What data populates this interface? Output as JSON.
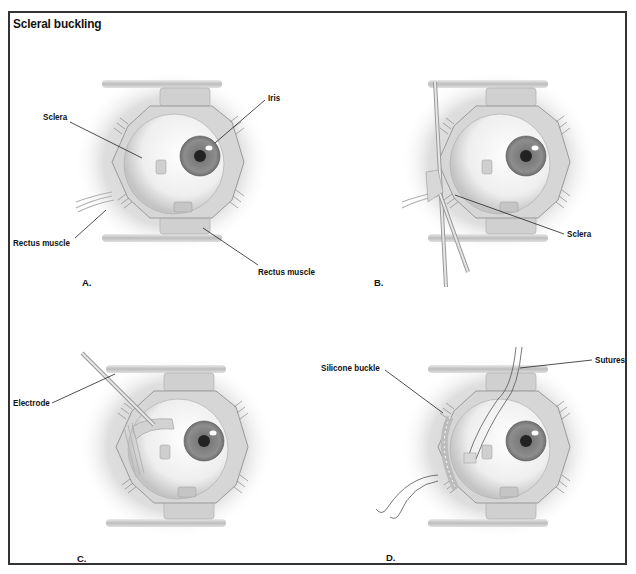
{
  "figure": {
    "title": "Scleral buckling",
    "panels": [
      {
        "letter": "A.",
        "labels": [
          "Sclera",
          "Iris",
          "Rectus muscle",
          "Rectus muscle"
        ]
      },
      {
        "letter": "B.",
        "labels": [
          "Sclera"
        ]
      },
      {
        "letter": "C.",
        "labels": [
          "Electrode"
        ]
      },
      {
        "letter": "D.",
        "labels": [
          "Silicone buckle",
          "Sutures"
        ]
      }
    ]
  },
  "colors": {
    "frame": "#333333",
    "halo": "#d9d9d9",
    "sclera": "#f2f2f2",
    "iris": "#8a8a8a",
    "pupil": "#222222",
    "speculum": "#c8c8c8",
    "leader_line": "#222222"
  }
}
